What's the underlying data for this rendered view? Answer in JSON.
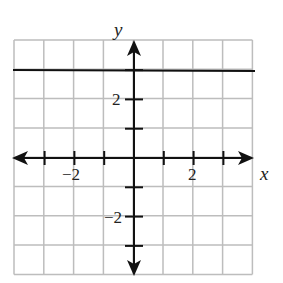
{
  "chart_data": {
    "type": "line",
    "title": "",
    "xlabel": "x",
    "ylabel": "y",
    "xlim": [
      -4,
      4
    ],
    "ylim": [
      -4,
      4
    ],
    "grid": true,
    "x_tick_labels": [
      "-2",
      "2"
    ],
    "y_tick_labels": [
      "2",
      "-2"
    ],
    "series": [
      {
        "name": "y = 3",
        "x": [
          -4,
          4
        ],
        "y": [
          3,
          3
        ]
      }
    ]
  },
  "labels": {
    "x_axis": "x",
    "y_axis": "y",
    "x_neg2": "−2",
    "x_pos2": "2",
    "y_pos2": "2",
    "y_neg2": "−2"
  }
}
